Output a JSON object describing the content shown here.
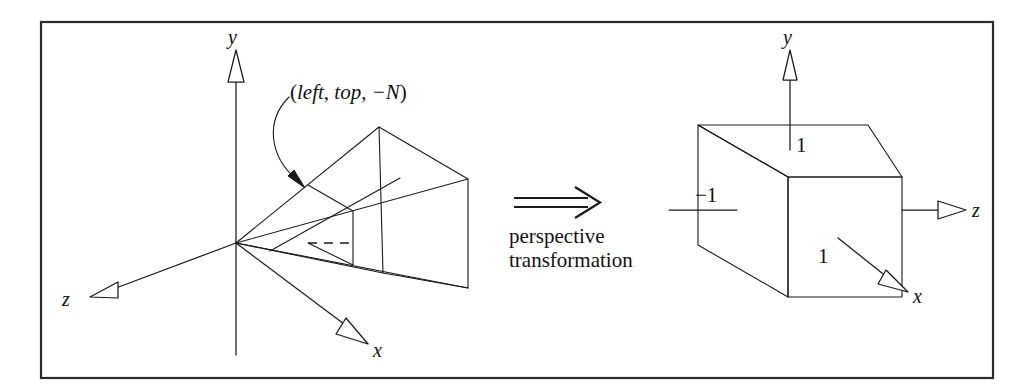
{
  "figure": {
    "caption": "perspective transformation",
    "transform_arrow_glyph": "double-right-arrow",
    "left_panel": {
      "name": "view-frustum",
      "axis_labels": {
        "x": "x",
        "y": "y",
        "z": "z"
      },
      "annotation": {
        "text": "(left, top, −N)",
        "parts": {
          "open": "(",
          "left": "left",
          "sep1": ", ",
          "top": "top",
          "sep2": ", ",
          "n": "−N",
          "close": ")"
        }
      }
    },
    "right_panel": {
      "name": "canonical-view-volume",
      "axis_labels": {
        "x": "x",
        "y": "y",
        "z": "z"
      },
      "tick_labels": {
        "y_top": "1",
        "x_left": "−1",
        "x_front": "1"
      }
    },
    "colors": {
      "ink": "#1a1a1a",
      "frame": "#2b2b2b",
      "background": "#ffffff"
    }
  }
}
